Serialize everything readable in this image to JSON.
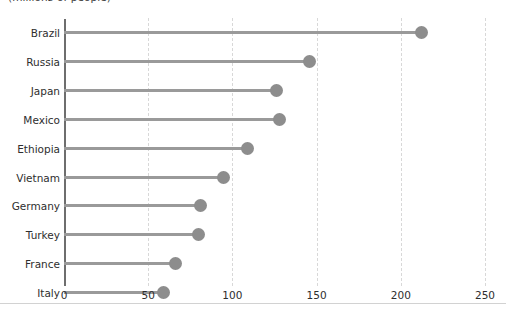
{
  "chart": {
    "subtitle": "(millions of people)",
    "units_note": "(millions of people)"
  },
  "colors": {
    "dot": "#8d8d8d",
    "stem": "#9a9a9a",
    "axis": "#6e6e6e",
    "gridline": "#d8d8d8",
    "text": "#2e2e2e",
    "baseline": "#d2d2d2",
    "background": "#ffffff"
  },
  "chart_data": {
    "type": "bar",
    "subtype": "lollipop-horizontal",
    "title": "",
    "subtitle": "(millions of people)",
    "xlabel": "",
    "ylabel": "",
    "xlim": [
      0,
      250
    ],
    "ylim": null,
    "grid": true,
    "grid_axis": "x",
    "legend": false,
    "orientation": "horizontal",
    "sorted": "descending",
    "xticks": [
      0,
      50,
      100,
      150,
      200,
      250
    ],
    "xticklabels": [
      "0",
      "50",
      "100",
      "150",
      "200",
      "250"
    ],
    "categories": [
      "Brazil",
      "Russia",
      "Japan",
      "Mexico",
      "Ethiopia",
      "Vietnam",
      "Germany",
      "Turkey",
      "France",
      "Italy"
    ],
    "values": [
      212,
      146,
      126,
      128,
      109,
      95,
      81,
      80,
      66,
      59
    ],
    "points": [
      {
        "category": "Brazil",
        "value": 212
      },
      {
        "category": "Russia",
        "value": 146
      },
      {
        "category": "Japan",
        "value": 126
      },
      {
        "category": "Mexico",
        "value": 128
      },
      {
        "category": "Ethiopia",
        "value": 109
      },
      {
        "category": "Vietnam",
        "value": 95
      },
      {
        "category": "Germany",
        "value": 81
      },
      {
        "category": "Turkey",
        "value": 80
      },
      {
        "category": "France",
        "value": 66
      },
      {
        "category": "Italy",
        "value": 59
      }
    ]
  }
}
